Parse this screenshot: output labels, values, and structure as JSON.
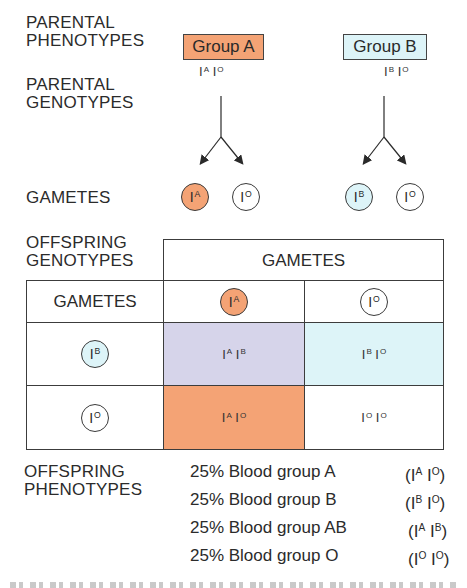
{
  "labels": {
    "parental_phenotypes": [
      "PARENTAL",
      "PHENOTYPES"
    ],
    "parental_genotypes": [
      "PARENTAL",
      "GENOTYPES"
    ],
    "gametes": "GAMETES",
    "offspring_genotypes": [
      "OFFSPRING",
      "GENOTYPES"
    ],
    "offspring_phenotypes": [
      "OFFSPRING",
      "PHENOTYPES"
    ]
  },
  "colors": {
    "group_a": "#F4A375",
    "group_b": "#DDF4F8",
    "ab_cell": "#D6D4EA",
    "border": "#3c3c3c"
  },
  "parents": [
    {
      "phenotype": "Group A",
      "genotype": [
        {
          "base": "I",
          "sup": "A"
        },
        {
          "base": "I",
          "sup": "O"
        }
      ],
      "gametes": [
        {
          "base": "I",
          "sup": "A",
          "fill": "#F4A375"
        },
        {
          "base": "I",
          "sup": "O",
          "fill": "#FFFFFF"
        }
      ]
    },
    {
      "phenotype": "Group B",
      "genotype": [
        {
          "base": "I",
          "sup": "B"
        },
        {
          "base": "I",
          "sup": "O"
        }
      ],
      "gametes": [
        {
          "base": "I",
          "sup": "B",
          "fill": "#DDF4F8"
        },
        {
          "base": "I",
          "sup": "O",
          "fill": "#FFFFFF"
        }
      ]
    }
  ],
  "punnett": {
    "header": "GAMETES",
    "corner": "GAMETES",
    "columns": [
      {
        "base": "I",
        "sup": "A",
        "fill": "#F4A375"
      },
      {
        "base": "I",
        "sup": "O",
        "fill": "#FFFFFF"
      }
    ],
    "rows": [
      {
        "gamete": {
          "base": "I",
          "sup": "B",
          "fill": "#DDF4F8"
        },
        "cells": [
          {
            "a": "A",
            "b": "B",
            "fill": "#D6D4EA"
          },
          {
            "a": "B",
            "b": "O",
            "fill": "#DDF4F8"
          }
        ]
      },
      {
        "gamete": {
          "base": "I",
          "sup": "O",
          "fill": "#FFFFFF"
        },
        "cells": [
          {
            "a": "A",
            "b": "O",
            "fill": "#F4A375"
          },
          {
            "a": "O",
            "b": "O",
            "fill": "#FFFFFF"
          }
        ]
      }
    ]
  },
  "results": [
    {
      "text": "25% Blood group A",
      "a": "A",
      "b": "O"
    },
    {
      "text": "25% Blood group B",
      "a": "B",
      "b": "O"
    },
    {
      "text": "25% Blood group AB",
      "a": "A",
      "b": "B"
    },
    {
      "text": "25% Blood group O",
      "a": "O",
      "b": "O"
    }
  ]
}
